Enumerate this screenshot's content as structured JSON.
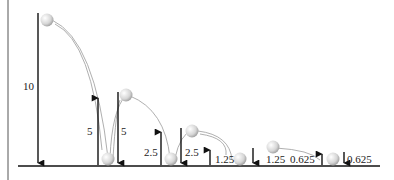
{
  "diagram": {
    "labels": {
      "drop_10": "10",
      "up_5": "5",
      "down_5": "5",
      "up_2_5": "2.5",
      "down_2_5": "2.5",
      "up_1_25": "1.25",
      "down_1_25": "1.25",
      "up_0_625": "0.625",
      "down_0_625": "0.625"
    },
    "colors": {
      "line": "#111111",
      "path": "#9a9a9a",
      "ball": "#d8d8d8"
    }
  }
}
